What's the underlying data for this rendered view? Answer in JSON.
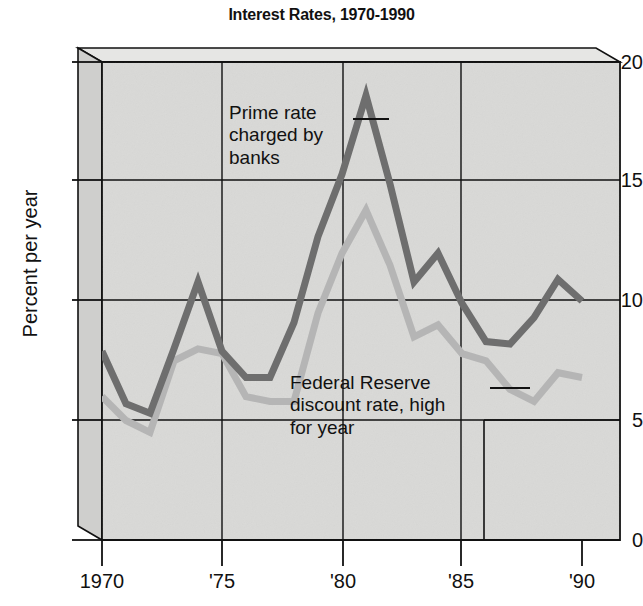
{
  "chart_data": {
    "type": "line",
    "title": "Interest Rates, 1970-1990",
    "xlabel": "",
    "ylabel": "Percent per year",
    "xlim": [
      1970,
      1990
    ],
    "ylim": [
      0,
      20
    ],
    "yticks": [
      0,
      5,
      10,
      15,
      20
    ],
    "ytick_labels": [
      "0",
      "5",
      "10",
      "15",
      "20"
    ],
    "xticks": [
      1970,
      1975,
      1980,
      1985,
      1990
    ],
    "xtick_labels": [
      "1970",
      "'75",
      "'80",
      "'85",
      "'90"
    ],
    "grid": true,
    "legend_position": "inline-annotations",
    "x": [
      1970,
      1971,
      1972,
      1973,
      1974,
      1975,
      1976,
      1977,
      1978,
      1979,
      1980,
      1981,
      1982,
      1983,
      1984,
      1985,
      1986,
      1987,
      1988,
      1989,
      1990
    ],
    "series": [
      {
        "name": "Prime rate charged by banks",
        "color": "#6e6e6e",
        "values": [
          7.9,
          5.7,
          5.3,
          8.0,
          10.8,
          7.9,
          6.8,
          6.8,
          9.1,
          12.7,
          15.3,
          18.6,
          14.9,
          10.8,
          12.0,
          9.9,
          8.3,
          8.2,
          9.3,
          10.9,
          10.0
        ]
      },
      {
        "name": "Federal Reserve discount rate, high for year",
        "color": "#b5b5b5",
        "values": [
          6.0,
          5.0,
          4.5,
          7.5,
          8.0,
          7.8,
          6.0,
          5.8,
          5.8,
          9.5,
          12.0,
          13.8,
          11.5,
          8.5,
          9.0,
          7.8,
          7.5,
          6.3,
          5.8,
          7.0,
          6.8
        ]
      }
    ],
    "annotations": [
      {
        "id": "prime",
        "lines": [
          "Prime rate",
          "charged by",
          "banks"
        ],
        "target_year": 1981,
        "leader": true
      },
      {
        "id": "fed",
        "lines": [
          "Federal Reserve",
          "discount rate, high",
          "for year"
        ],
        "target_year": 1986,
        "leader": true
      }
    ]
  },
  "colors": {
    "panel": "#d8d8d6",
    "panel_top": "#e2e2e0",
    "panel_side": "#cfcfcd",
    "grid": "#111111",
    "frame": "#111111",
    "prime": "#6e6e6e",
    "discount": "#b5b5b5",
    "text": "#111111"
  }
}
